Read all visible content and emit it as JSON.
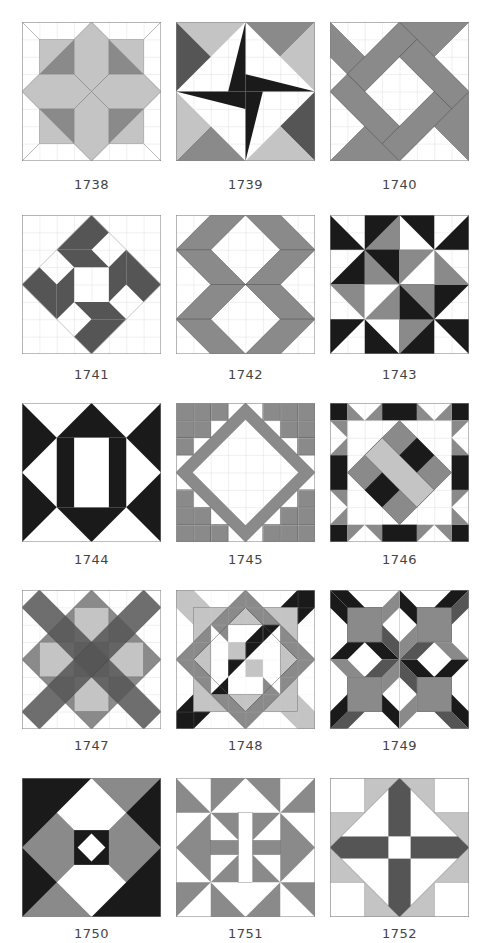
{
  "colors": {
    "light": "#c4c4c4",
    "mid": "#8a8a8a",
    "dark": "#555555",
    "black": "#1a1a1a",
    "grid": "#cfcfcf",
    "white": "#ffffff"
  },
  "blocks": [
    {
      "number": "1738"
    },
    {
      "number": "1739"
    },
    {
      "number": "1740"
    },
    {
      "number": "1741"
    },
    {
      "number": "1742"
    },
    {
      "number": "1743"
    },
    {
      "number": "1744"
    },
    {
      "number": "1745"
    },
    {
      "number": "1746"
    },
    {
      "number": "1747"
    },
    {
      "number": "1748"
    },
    {
      "number": "1749"
    },
    {
      "number": "1750"
    },
    {
      "number": "1751"
    },
    {
      "number": "1752"
    }
  ]
}
